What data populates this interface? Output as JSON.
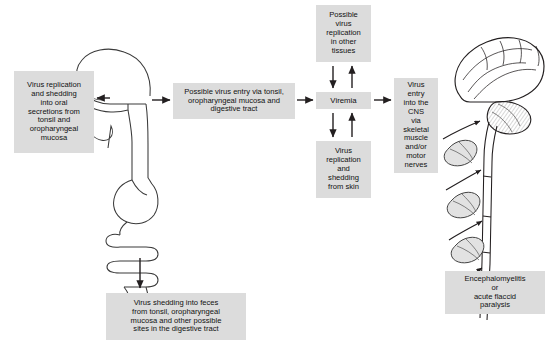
{
  "diagram": {
    "box_fill": "#dcdcdc",
    "stroke": "#231f20",
    "boxes": {
      "virus_replication_oral": "Virus replication\nand shedding\ninto oral\nsecretions from\ntonsil and\noropharyngeal\nmucosa",
      "possible_virus_entry": "Possible virus entry via tonsil,\noropharyngeal mucosa and\ndigestive tract",
      "possible_replication_other_tissues": "Possible\nvirus\nreplication\nin other\ntissues",
      "viremia": "Viremia",
      "virus_replication_skin": "Virus\nreplication\nand\nshedding\nfrom skin",
      "virus_entry_cns": "Virus\nentry\ninto the\nCNS\nvia\nskeletal\nmuscle\nand/or\nmotor\nnerves",
      "virus_shedding_feces": "Virus shedding into feces\nfrom tonsil, oropharyngeal\nmucosa and other possible\nsites in the digestive tract",
      "encephalomyelitis": "Encephalomyelitis\nor\nacute flaccid\nparalysis"
    },
    "illustrations": {
      "left": "head-and-digestive-tract-illustration",
      "right": "brain-spinal-cord-and-muscles-illustration"
    },
    "arrows": [
      {
        "name": "throat-to-oral-box",
        "direction": "left"
      },
      {
        "name": "throat-to-entry-box",
        "direction": "right"
      },
      {
        "name": "entry-to-viremia",
        "direction": "right"
      },
      {
        "name": "viremia-to-other-tissues",
        "direction": "up"
      },
      {
        "name": "other-tissues-to-viremia",
        "direction": "down"
      },
      {
        "name": "viremia-to-skin",
        "direction": "down"
      },
      {
        "name": "skin-to-viremia",
        "direction": "up"
      },
      {
        "name": "viremia-to-cns",
        "direction": "right"
      },
      {
        "name": "gut-to-feces",
        "direction": "down"
      },
      {
        "name": "muscle-to-spinal-cord-upper",
        "direction": "up-right"
      },
      {
        "name": "muscle-to-spinal-cord-middle",
        "direction": "up-right"
      },
      {
        "name": "muscle-to-spinal-cord-lower",
        "direction": "up-right"
      }
    ]
  }
}
